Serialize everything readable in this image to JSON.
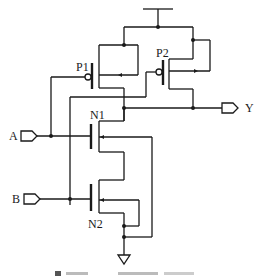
{
  "diagram": {
    "type": "CMOS 2-input NOR gate transistor schematic",
    "inputs": [
      {
        "label": "A"
      },
      {
        "label": "B"
      }
    ],
    "outputs": [
      {
        "label": "Y"
      }
    ],
    "transistors": [
      {
        "label": "P1",
        "type": "PMOS"
      },
      {
        "label": "P2",
        "type": "PMOS"
      },
      {
        "label": "N1",
        "type": "NMOS"
      },
      {
        "label": "N2",
        "type": "NMOS"
      }
    ],
    "supply": "VDD",
    "ground": "GND",
    "caption": ""
  }
}
